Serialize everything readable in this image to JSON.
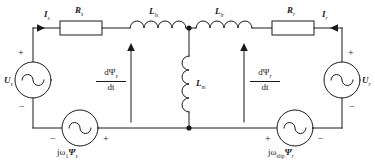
{
  "diagram": {
    "type": "electrical-circuit-schematic",
    "stroke_color": "#1a1a1a",
    "background_color": "#ffffff"
  },
  "components": {
    "stator_resistor": {
      "label": "R",
      "subscript": "s",
      "name": "stator resistance"
    },
    "rotor_resistor": {
      "label": "R",
      "subscript": "r",
      "name": "rotor resistance"
    },
    "stator_leakage_inductor": {
      "label": "L",
      "subscript": "ls",
      "name": "stator leakage inductance"
    },
    "rotor_leakage_inductor": {
      "label": "L",
      "subscript": "lr",
      "name": "rotor leakage inductance"
    },
    "magnetizing_inductor": {
      "label": "L",
      "subscript": "m",
      "name": "magnetizing inductance"
    },
    "stator_voltage_source": {
      "label": "U",
      "subscript": "s",
      "name": "stator terminal voltage"
    },
    "rotor_voltage_source": {
      "label": "U",
      "subscript": "r",
      "name": "rotor terminal voltage"
    },
    "stator_emf_source": {
      "label": "jω",
      "subscript": "1",
      "flux": "Ψ",
      "flux_subscript": "s",
      "full": "jω1Ψs"
    },
    "rotor_emf_source": {
      "label": "jω",
      "subscript": "slip",
      "flux": "Ψ",
      "flux_subscript": "r",
      "full": "jωslipΨr"
    }
  },
  "currents": {
    "stator_current": {
      "label": "I",
      "subscript": "s",
      "direction": "right"
    },
    "rotor_current": {
      "label": "I",
      "subscript": "r",
      "direction": "left"
    }
  },
  "flux_derivatives": {
    "stator": {
      "numerator": "dΨ",
      "numerator_sub": "s",
      "denominator": "dt",
      "arrow": "up"
    },
    "rotor": {
      "numerator": "dΨ",
      "numerator_sub": "r",
      "denominator": "dt",
      "arrow": "up"
    }
  },
  "polarities": {
    "stator_source_plus": "+",
    "stator_source_minus": "−",
    "rotor_source_plus": "+",
    "rotor_source_minus": "−",
    "stator_emf_minus": "−",
    "stator_emf_plus": "+",
    "rotor_emf_plus": "+",
    "rotor_emf_minus": "−"
  }
}
